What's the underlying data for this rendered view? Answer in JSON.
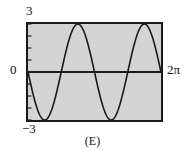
{
  "caption": "(E)",
  "colors": {
    "plot_background": "#d4d4d4",
    "frame": "#1a1a1a",
    "curve": "#1a1a1a",
    "axis": "#1a1a1a",
    "text": "#111111",
    "page_background": "#ffffff"
  },
  "labels": {
    "y_max": "3",
    "y_zero": "0",
    "y_min": "−3",
    "x_max": "2π"
  },
  "chart_data": {
    "type": "line",
    "title": "",
    "subtitle": "",
    "xlabel": "",
    "ylabel": "",
    "xlim": [
      0,
      6.283185307179586
    ],
    "ylim": [
      -3,
      3
    ],
    "grid": false,
    "legend": null,
    "xtick_labels": [
      "0",
      "2π"
    ],
    "ytick_labels": [
      "3",
      "0",
      "−3"
    ],
    "ytick_values": [
      3,
      0,
      -3
    ],
    "xtick_values": [
      0,
      6.283185307179586
    ],
    "annotations": [
      "(E)"
    ],
    "series": [
      {
        "name": "y = -3 sin(2x)",
        "formula": "-3*sin(2*x)",
        "amplitude": 3,
        "frequency": 2,
        "periods_shown": 2,
        "phase": "starts at 0 descending",
        "x": [
          0.0,
          0.1963,
          0.3927,
          0.589,
          0.7854,
          0.9817,
          1.1781,
          1.3744,
          1.5708,
          1.7671,
          1.9635,
          2.1598,
          2.3562,
          2.5525,
          2.7489,
          2.9452,
          3.1416,
          3.3379,
          3.5343,
          3.7306,
          3.927,
          4.1233,
          4.3197,
          4.516,
          4.7124,
          4.9087,
          5.1051,
          5.3014,
          5.4978,
          5.6941,
          5.8905,
          6.0868,
          6.2832
        ],
        "values": [
          0.0,
          -1.1481,
          -2.1213,
          -2.7716,
          -3.0,
          -2.7716,
          -2.1213,
          -1.1481,
          0.0,
          1.1481,
          2.1213,
          2.7716,
          3.0,
          2.7716,
          2.1213,
          1.1481,
          0.0,
          -1.1481,
          -2.1213,
          -2.7716,
          -3.0,
          -2.7716,
          -2.1213,
          -1.1481,
          0.0,
          1.1481,
          2.1213,
          2.7716,
          3.0,
          2.7716,
          2.1213,
          1.1481,
          0.0
        ]
      }
    ]
  }
}
